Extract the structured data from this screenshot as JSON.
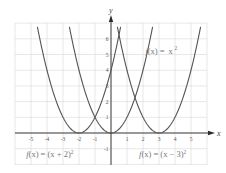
{
  "chart_data": {
    "type": "line",
    "title": "",
    "xlabel": "x",
    "ylabel": "y",
    "xlim": [
      -6,
      6
    ],
    "ylim": [
      -2,
      7
    ],
    "grid": true,
    "x_ticks": [
      -5,
      -4,
      -3,
      -2,
      -1,
      1,
      2,
      3,
      4,
      5
    ],
    "y_ticks": [
      -1,
      1,
      2,
      3,
      4,
      5,
      6
    ],
    "series": [
      {
        "name": "f(x) = (x + 2)^2",
        "label": "f(x) = (x + 2)",
        "exponent": "2",
        "h": -2,
        "x_range": [
          -4.6,
          0.6
        ]
      },
      {
        "name": "f(x) = x^2",
        "label": "f(x) = x",
        "exponent": "2",
        "h": 0,
        "x_range": [
          -2.6,
          2.6
        ]
      },
      {
        "name": "f(x) = (x − 3)^2",
        "label": "f(x) = (x − 3)",
        "exponent": "2",
        "h": 3,
        "x_range": [
          0.4,
          5.6
        ]
      }
    ],
    "annotations": [
      {
        "text": "f(x) = x²",
        "x": 2.2,
        "y": 5.1
      },
      {
        "text": "f(x) = (x + 2)²",
        "x": -5.4,
        "y": -1.5
      },
      {
        "text": "f(x) = (x − 3)²",
        "x": 1.7,
        "y": -1.5
      }
    ]
  },
  "layout": {
    "origin_px": [
      111,
      133
    ],
    "unit_x_px": 16,
    "unit_y_px": 15.7,
    "grid_px": {
      "left": 15,
      "right": 207,
      "top": 23,
      "bottom": 165
    }
  }
}
